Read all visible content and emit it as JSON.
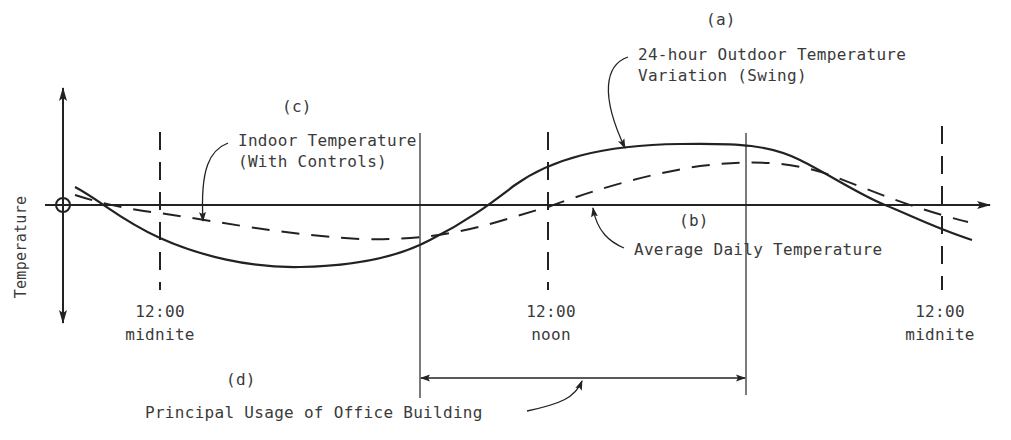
{
  "diagram": {
    "y_axis_label": "Temperature",
    "stroke_color": "#222222",
    "text_color": "#3a3a3a",
    "background": "#ffffff"
  },
  "labels": {
    "a": {
      "tag": "(a)",
      "line1": "24-hour Outdoor Temperature",
      "line2": "Variation (Swing)"
    },
    "b": {
      "tag": "(b)",
      "text": "Average Daily Temperature"
    },
    "c": {
      "tag": "(c)",
      "line1": "Indoor Temperature",
      "line2": "(With Controls)"
    },
    "d": {
      "tag": "(d)",
      "text": "Principal Usage of Office Building"
    }
  },
  "time_markers": [
    {
      "time": "12:00",
      "label": "midnite"
    },
    {
      "time": "12:00",
      "label": "noon"
    },
    {
      "time": "12:00",
      "label": "midnite"
    }
  ],
  "series": [
    {
      "name": "24-hour Outdoor Temperature Variation (Swing)",
      "style": "solid"
    },
    {
      "name": "Indoor Temperature (With Controls)",
      "style": "dashed"
    },
    {
      "name": "Average Daily Temperature",
      "style": "axis-line"
    }
  ],
  "usage_span": {
    "from": "before noon",
    "to": "afternoon",
    "label": "Principal Usage of Office Building"
  }
}
